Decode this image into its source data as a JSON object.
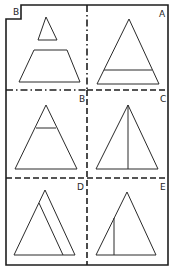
{
  "figure": {
    "corner_label": "B",
    "reference_panel": {
      "shapes": [
        "small triangle",
        "trapezoid"
      ]
    },
    "options": [
      {
        "label": "A",
        "description": "triangle with horizontal line near base"
      },
      {
        "label": "B",
        "description": "triangle with horizontal line near apex"
      },
      {
        "label": "C",
        "description": "triangle with vertical line from apex to base"
      },
      {
        "label": "D",
        "description": "two overlapping triangles sharing left base corner"
      },
      {
        "label": "E",
        "description": "triangle with short vertical line in left half"
      }
    ]
  }
}
